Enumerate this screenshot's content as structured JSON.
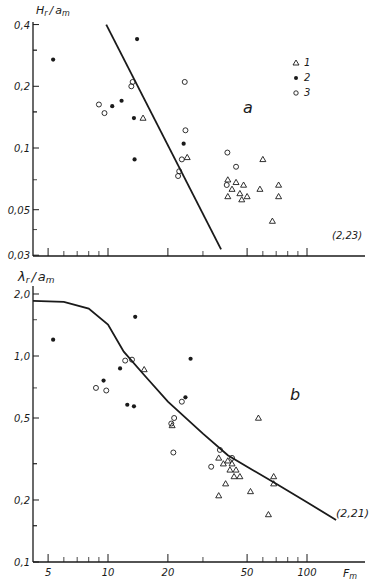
{
  "chart_data": [
    {
      "id": "a",
      "type": "scatter",
      "panel_label": "a",
      "ylabel": "H_r / a_m",
      "xlabel": "F_m",
      "xscale": "log",
      "yscale": "log",
      "xlim": [
        4,
        200
      ],
      "ylim": [
        0.03,
        0.42
      ],
      "yticks": [
        "0,4",
        "0,2",
        "0,1",
        "0,05",
        "0,03"
      ],
      "annotation": "(2,23)",
      "legend": [
        {
          "marker": "triangle-open",
          "label": "1"
        },
        {
          "marker": "circle-filled",
          "label": "2"
        },
        {
          "marker": "circle-open",
          "label": "3"
        }
      ],
      "line": {
        "x": [
          9.8,
          37
        ],
        "y": [
          0.4,
          0.032
        ]
      },
      "series": [
        {
          "name": "1",
          "marker": "triangle-open",
          "points": [
            [
              15,
              0.14
            ],
            [
              25,
              0.09
            ],
            [
              40,
              0.07
            ],
            [
              44,
              0.068
            ],
            [
              48,
              0.066
            ],
            [
              42,
              0.063
            ],
            [
              46,
              0.06
            ],
            [
              50,
              0.058
            ],
            [
              40,
              0.058
            ],
            [
              58,
              0.063
            ],
            [
              60,
              0.088
            ],
            [
              72,
              0.066
            ],
            [
              72,
              0.058
            ],
            [
              67,
              0.044
            ],
            [
              47,
              0.056
            ]
          ]
        },
        {
          "name": "2",
          "marker": "circle-filled",
          "points": [
            [
              5.3,
              0.27
            ],
            [
              14,
              0.34
            ],
            [
              10.5,
              0.16
            ],
            [
              11.7,
              0.17
            ],
            [
              13.5,
              0.14
            ],
            [
              13.6,
              0.088
            ],
            [
              24,
              0.105
            ]
          ]
        },
        {
          "name": "3",
          "marker": "circle-open",
          "points": [
            [
              9,
              0.163
            ],
            [
              9.6,
              0.148
            ],
            [
              13.1,
              0.2
            ],
            [
              13.3,
              0.21
            ],
            [
              24.3,
              0.21
            ],
            [
              24.5,
              0.122
            ],
            [
              22.8,
              0.077
            ],
            [
              22.5,
              0.073
            ],
            [
              23.5,
              0.088
            ],
            [
              39.8,
              0.095
            ],
            [
              44,
              0.081
            ],
            [
              39.5,
              0.066
            ]
          ]
        }
      ]
    },
    {
      "id": "b",
      "type": "scatter",
      "panel_label": "b",
      "ylabel": "λ_r / a_m",
      "xlabel": "F_m",
      "xscale": "log",
      "yscale": "log",
      "xlim": [
        4,
        200
      ],
      "ylim": [
        0.1,
        2.1
      ],
      "xticks": [
        "5",
        "10",
        "20",
        "50",
        "100"
      ],
      "yticks": [
        "2,0",
        "1,0",
        "0,5",
        "0,2",
        "0,1"
      ],
      "annotation": "(2,21)",
      "curve": {
        "x": [
          4,
          6,
          8,
          10,
          12,
          15,
          20,
          30,
          40,
          50,
          70,
          100,
          140
        ],
        "y": [
          1.85,
          1.83,
          1.7,
          1.42,
          1.05,
          0.82,
          0.6,
          0.42,
          0.33,
          0.29,
          0.24,
          0.195,
          0.16
        ]
      },
      "series": [
        {
          "name": "1",
          "marker": "triangle-open",
          "points": [
            [
              15.2,
              0.86
            ],
            [
              21,
              0.46
            ],
            [
              57,
              0.5
            ],
            [
              36,
              0.32
            ],
            [
              38,
              0.3
            ],
            [
              40,
              0.31
            ],
            [
              42,
              0.3
            ],
            [
              41,
              0.28
            ],
            [
              44,
              0.28
            ],
            [
              43,
              0.26
            ],
            [
              46,
              0.26
            ],
            [
              39,
              0.24
            ],
            [
              36,
              0.21
            ],
            [
              52,
              0.22
            ],
            [
              68,
              0.26
            ],
            [
              68,
              0.24
            ],
            [
              64,
              0.17
            ]
          ]
        },
        {
          "name": "2",
          "marker": "circle-filled",
          "points": [
            [
              5.3,
              1.2
            ],
            [
              13.7,
              1.55
            ],
            [
              11.5,
              0.87
            ],
            [
              9.5,
              0.76
            ],
            [
              12.5,
              0.58
            ],
            [
              13.5,
              0.57
            ],
            [
              26,
              0.97
            ],
            [
              24.5,
              0.63
            ]
          ]
        },
        {
          "name": "3",
          "marker": "circle-open",
          "points": [
            [
              8.7,
              0.7
            ],
            [
              9.8,
              0.68
            ],
            [
              12.2,
              0.95
            ],
            [
              13.2,
              0.96
            ],
            [
              23.5,
              0.6
            ],
            [
              21.5,
              0.5
            ],
            [
              20.8,
              0.47
            ],
            [
              21.3,
              0.34
            ],
            [
              36.5,
              0.35
            ],
            [
              33,
              0.29
            ],
            [
              42,
              0.32
            ]
          ]
        }
      ]
    }
  ],
  "axis": {
    "x_label": "F_m"
  },
  "panels": {
    "a": {
      "y_label_main": "H",
      "y_label_sub_r": "r",
      "y_label_slash": "/",
      "y_label_a": "a",
      "y_label_sub_m": "m",
      "tag": "a",
      "note": "(2,23)",
      "y_ticks": [
        {
          "v": 0.4,
          "t": "0,4"
        },
        {
          "v": 0.2,
          "t": "0,2"
        },
        {
          "v": 0.1,
          "t": "0,1"
        },
        {
          "v": 0.05,
          "t": "0,05"
        },
        {
          "v": 0.03,
          "t": "0,03"
        }
      ],
      "legend": [
        {
          "label": "1"
        },
        {
          "label": "2"
        },
        {
          "label": "3"
        }
      ]
    },
    "b": {
      "y_label_main": "λ",
      "y_label_sub_r": "r",
      "y_label_slash": "/",
      "y_label_a": "a",
      "y_label_sub_m": "m",
      "tag": "b",
      "note": "(2,21)",
      "y_ticks": [
        {
          "v": 2.0,
          "t": "2,0"
        },
        {
          "v": 1.0,
          "t": "1,0"
        },
        {
          "v": 0.5,
          "t": "0,5"
        },
        {
          "v": 0.2,
          "t": "0,2"
        },
        {
          "v": 0.1,
          "t": "0,1"
        }
      ],
      "x_ticks": [
        {
          "v": 5,
          "t": "5"
        },
        {
          "v": 10,
          "t": "10"
        },
        {
          "v": 20,
          "t": "20"
        },
        {
          "v": 50,
          "t": "50"
        },
        {
          "v": 100,
          "t": "100"
        }
      ]
    }
  }
}
